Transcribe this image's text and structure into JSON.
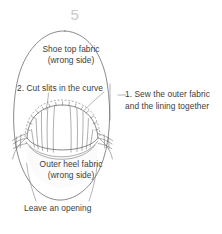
{
  "figure": {
    "step_number": "5",
    "type": "sewing-instruction-diagram",
    "background_color": "#ffffff",
    "line_color": "#585858",
    "step_number_color": "#c9c9c9",
    "text_color": "#3d3d3d"
  },
  "labels": {
    "shoe_top_line1": "Shoe top fabric",
    "shoe_top_line2": "(wrong side)",
    "cut_slits": "2. Cut slits in the curve",
    "sew_line1": "1. Sew the outer fabric",
    "sew_line2": "and the lining together",
    "outer_heel_line1": "Outer heel fabric",
    "outer_heel_line2": "(wrong side)",
    "leave_opening": "Leave an opening"
  },
  "icons": {
    "slit_tick": "slit-tick-mark",
    "stitch_dash": "dashed-stitch-line",
    "leader": "leader-line"
  }
}
